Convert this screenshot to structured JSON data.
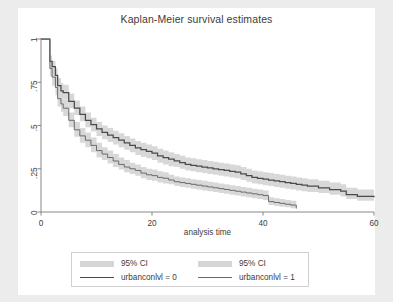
{
  "figure": {
    "title": "Kaplan-Meier survival estimates",
    "background_color": "#ececec",
    "panel_color": "#ffffff"
  },
  "chart_data": {
    "type": "line",
    "title": "Kaplan-Meier survival estimates",
    "xlabel": "analysis time",
    "ylabel": "",
    "xlim": [
      0,
      60
    ],
    "ylim": [
      0,
      1
    ],
    "grid": false,
    "xticks": [
      0,
      20,
      40,
      60
    ],
    "xtick_labels": [
      "0",
      "20",
      "40",
      "60"
    ],
    "yticks": [
      0,
      0.25,
      0.5,
      0.75,
      1
    ],
    "ytick_labels": [
      "0",
      ".25",
      ".5",
      ".75",
      "1"
    ],
    "legend_position": "bottom",
    "band_color": "#d6d6d6",
    "line_color_0": "#4a4a4a",
    "line_color_1": "#6a6a6a",
    "legend": [
      {
        "label": "95% CI",
        "kind": "band",
        "series": 0
      },
      {
        "label": "95% CI",
        "kind": "band",
        "series": 1
      },
      {
        "label": "urbanconlvl = 0",
        "kind": "line",
        "series": 0
      },
      {
        "label": "urbanconlvl = 1",
        "kind": "line",
        "series": 1
      }
    ],
    "series": [
      {
        "name": "urbanconlvl = 0",
        "style": "step",
        "x": [
          0,
          1,
          1.6,
          2,
          2.6,
          3,
          3.6,
          4,
          5,
          6,
          7,
          8,
          9,
          10,
          11,
          12,
          13,
          14,
          15,
          16,
          17,
          18,
          19,
          20,
          21,
          22,
          23,
          24,
          25,
          26,
          27,
          28,
          29,
          30,
          31,
          32,
          33,
          34,
          35,
          36,
          37,
          38,
          39,
          40,
          41,
          42,
          43,
          44,
          45,
          46,
          47,
          48,
          50,
          52,
          54,
          55,
          57,
          60
        ],
        "y": [
          1.0,
          1.0,
          0.87,
          0.84,
          0.79,
          0.73,
          0.7,
          0.69,
          0.64,
          0.6,
          0.565,
          0.53,
          0.505,
          0.48,
          0.46,
          0.445,
          0.43,
          0.415,
          0.4,
          0.385,
          0.37,
          0.36,
          0.35,
          0.34,
          0.325,
          0.315,
          0.305,
          0.295,
          0.285,
          0.275,
          0.27,
          0.265,
          0.26,
          0.255,
          0.25,
          0.245,
          0.24,
          0.235,
          0.23,
          0.22,
          0.21,
          0.2,
          0.195,
          0.19,
          0.185,
          0.18,
          0.175,
          0.17,
          0.165,
          0.16,
          0.155,
          0.15,
          0.14,
          0.13,
          0.12,
          0.1,
          0.09,
          0.085
        ],
        "ci_lower": [
          1.0,
          1.0,
          0.835,
          0.8,
          0.75,
          0.69,
          0.66,
          0.65,
          0.6,
          0.56,
          0.525,
          0.49,
          0.465,
          0.44,
          0.42,
          0.405,
          0.39,
          0.375,
          0.36,
          0.345,
          0.33,
          0.32,
          0.31,
          0.3,
          0.285,
          0.275,
          0.265,
          0.26,
          0.25,
          0.24,
          0.235,
          0.23,
          0.225,
          0.22,
          0.215,
          0.21,
          0.205,
          0.2,
          0.195,
          0.185,
          0.175,
          0.165,
          0.16,
          0.155,
          0.15,
          0.145,
          0.14,
          0.135,
          0.13,
          0.125,
          0.12,
          0.115,
          0.11,
          0.1,
          0.09,
          0.075,
          0.065,
          0.06
        ],
        "ci_upper": [
          1.0,
          1.0,
          0.905,
          0.875,
          0.83,
          0.775,
          0.745,
          0.735,
          0.685,
          0.645,
          0.61,
          0.575,
          0.545,
          0.52,
          0.5,
          0.485,
          0.47,
          0.455,
          0.44,
          0.425,
          0.41,
          0.4,
          0.39,
          0.38,
          0.365,
          0.355,
          0.345,
          0.335,
          0.325,
          0.315,
          0.31,
          0.305,
          0.3,
          0.295,
          0.29,
          0.285,
          0.28,
          0.275,
          0.27,
          0.26,
          0.25,
          0.24,
          0.235,
          0.23,
          0.225,
          0.22,
          0.215,
          0.21,
          0.205,
          0.2,
          0.195,
          0.19,
          0.18,
          0.17,
          0.16,
          0.14,
          0.13,
          0.125
        ]
      },
      {
        "name": "urbanconlvl = 1",
        "style": "step",
        "x": [
          0,
          1,
          1.6,
          2,
          2.6,
          3,
          3.6,
          4,
          5,
          6,
          7,
          8,
          9,
          10,
          11,
          12,
          13,
          14,
          15,
          16,
          17,
          18,
          19,
          20,
          21,
          22,
          23,
          24,
          25,
          26,
          27,
          28,
          29,
          30,
          31,
          32,
          33,
          34,
          35,
          36,
          37,
          38,
          39,
          40,
          41,
          42,
          43,
          44,
          45,
          46
        ],
        "y": [
          1.0,
          1.0,
          0.83,
          0.78,
          0.72,
          0.655,
          0.625,
          0.6,
          0.53,
          0.475,
          0.44,
          0.415,
          0.385,
          0.355,
          0.335,
          0.315,
          0.295,
          0.275,
          0.26,
          0.25,
          0.24,
          0.225,
          0.215,
          0.21,
          0.2,
          0.195,
          0.185,
          0.175,
          0.17,
          0.165,
          0.16,
          0.155,
          0.15,
          0.145,
          0.14,
          0.135,
          0.13,
          0.125,
          0.12,
          0.115,
          0.11,
          0.105,
          0.1,
          0.095,
          0.06,
          0.055,
          0.05,
          0.045,
          0.04,
          0.02
        ],
        "ci_lower": [
          1.0,
          1.0,
          0.785,
          0.73,
          0.675,
          0.61,
          0.58,
          0.555,
          0.49,
          0.435,
          0.4,
          0.375,
          0.345,
          0.315,
          0.3,
          0.28,
          0.26,
          0.245,
          0.23,
          0.22,
          0.21,
          0.195,
          0.185,
          0.18,
          0.17,
          0.165,
          0.16,
          0.15,
          0.145,
          0.14,
          0.135,
          0.13,
          0.125,
          0.12,
          0.115,
          0.11,
          0.105,
          0.1,
          0.095,
          0.09,
          0.085,
          0.08,
          0.075,
          0.07,
          0.04,
          0.035,
          0.03,
          0.027,
          0.022,
          0.008
        ],
        "ci_upper": [
          1.0,
          1.0,
          0.875,
          0.83,
          0.77,
          0.705,
          0.675,
          0.65,
          0.575,
          0.52,
          0.485,
          0.46,
          0.43,
          0.4,
          0.375,
          0.355,
          0.335,
          0.315,
          0.3,
          0.285,
          0.275,
          0.26,
          0.25,
          0.245,
          0.235,
          0.23,
          0.215,
          0.205,
          0.2,
          0.195,
          0.19,
          0.185,
          0.18,
          0.175,
          0.17,
          0.165,
          0.16,
          0.155,
          0.15,
          0.145,
          0.14,
          0.135,
          0.13,
          0.125,
          0.085,
          0.08,
          0.075,
          0.07,
          0.065,
          0.04
        ]
      }
    ]
  }
}
